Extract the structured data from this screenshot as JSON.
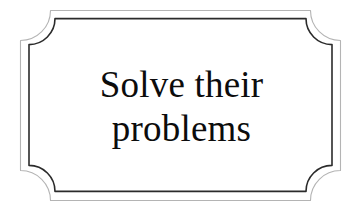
{
  "image": {
    "kind": "decorative-plaque-sign",
    "width": 363,
    "height": 212,
    "background_color": "#ffffff"
  },
  "plaque": {
    "name": "double-line-notched-corner-plaque",
    "fill_color": "#ffffff",
    "outer_border": {
      "color": "#b4b4b4",
      "stroke_width": 1.1
    },
    "inner_border": {
      "color": "#2b2b2b",
      "stroke_width": 1.6
    },
    "outer_rect": {
      "x": 20.5,
      "y": 10.5,
      "width": 320,
      "height": 190,
      "corner_notch_radius": 30
    },
    "inner_rect": {
      "x": 29.0,
      "y": 18.5,
      "width": 303,
      "height": 173,
      "corner_notch_radius": 26
    }
  },
  "text": {
    "color": "#0c0c0c",
    "font_size_px": 37,
    "align": "center",
    "lines": [
      "Solve their",
      "problems"
    ],
    "full_text": "Solve their problems"
  }
}
